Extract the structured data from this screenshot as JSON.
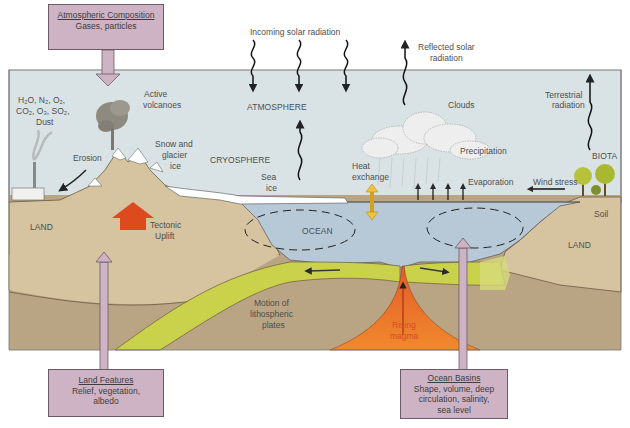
{
  "diagram": {
    "boxes": {
      "atmospheric_composition": {
        "title": "Atmospheric Composition",
        "lines": [
          "Gases, particles"
        ]
      },
      "land_features": {
        "title": "Land Features",
        "lines": [
          "Relief, vegetation,",
          "albedo"
        ]
      },
      "ocean_basins": {
        "title": "Ocean Basins",
        "lines": [
          "Shape, volume, deep",
          "circulation, salinity,",
          "sea level"
        ]
      }
    },
    "radiation": {
      "incoming": "Incoming solar radiation",
      "reflected_line1": "Reflected solar",
      "reflected_line2": "radiation",
      "terrestrial_line1": "Terrestrial",
      "terrestrial_line2": "radiation"
    },
    "labels": {
      "gases_line1": "H₂O, N₂, O₂,",
      "gases_line2": "CO₂, O₃, SO₂,",
      "gases_line3": "Dust",
      "active_volcanoes_line1": "Active",
      "active_volcanoes_line2": "volcanoes",
      "atmosphere": "ATMOSPHERE",
      "clouds": "Clouds",
      "precipitation": "Precipitation",
      "biota": "BIOTA",
      "erosion": "Erosion",
      "snow_line1": "Snow and",
      "snow_line2": "glacier",
      "snow_line3": "ice",
      "cryosphere": "CRYOSPHERE",
      "sea_ice_line1": "Sea",
      "sea_ice_line2": "ice",
      "heat_line1": "Heat",
      "heat_line2": "exchange",
      "evaporation": "Evaporation",
      "wind_stress": "Wind stress",
      "land_left": "LAND",
      "land_right": "LAND",
      "soil": "Soil",
      "tectonic_line1": "Tectonic",
      "tectonic_line2": "Uplift",
      "ocean": "OCEAN",
      "motion_line1": "Motion of",
      "motion_line2": "lithospheric",
      "motion_line3": "plates",
      "magma_line1": "Rising",
      "magma_line2": "magma"
    },
    "colors": {
      "sky": "#d9e3e6",
      "land": "#d6c3a0",
      "deep_land": "#b9a583",
      "ocean": "#b7c9d6",
      "plate": "#c9d24a",
      "magma": "#e8632a",
      "box": "#cdb3c4",
      "tectonic_arrow": "#dd4a1e",
      "heat_arrow": "#f0c23a"
    }
  }
}
